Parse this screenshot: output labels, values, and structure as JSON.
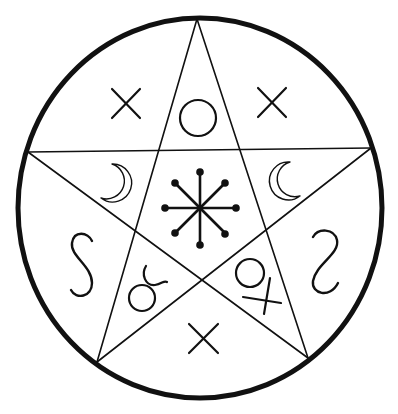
{
  "diagram": {
    "title": "Pentagram seal with planetary and alchemical symbols",
    "colors": {
      "ink": "#111111",
      "background": "#ffffff"
    },
    "outer_circle": {
      "cx": 200,
      "cy": 208,
      "rx": 182,
      "ry": 190,
      "stroke_width": 5
    },
    "pentagram": {
      "stroke_width": 1.6,
      "vertices": {
        "top": [
          197,
          19
        ],
        "left": [
          28,
          152
        ],
        "right": [
          371,
          148
        ],
        "bottom_left": [
          97,
          362
        ],
        "bottom_right": [
          308,
          358
        ]
      }
    },
    "symbols": [
      {
        "id": "cross-upper-left",
        "glyph": "cross",
        "region": "outer-upper-left",
        "x": 126,
        "y": 103
      },
      {
        "id": "circle-top",
        "glyph": "circle",
        "region": "top-point",
        "x": 198,
        "y": 118
      },
      {
        "id": "cross-upper-right",
        "glyph": "cross",
        "region": "outer-upper-right",
        "x": 271,
        "y": 102
      },
      {
        "id": "moon-left",
        "glyph": "crescent-moon-right-facing",
        "region": "left-point",
        "x": 122,
        "y": 181
      },
      {
        "id": "eight-spoke-star",
        "glyph": "eight-spoked-star-with-dots",
        "region": "center-pentagon",
        "x": 200,
        "y": 208
      },
      {
        "id": "moon-right",
        "glyph": "crescent-moon-left-facing",
        "region": "right-point",
        "x": 282,
        "y": 180
      },
      {
        "id": "s-left",
        "glyph": "s-curve",
        "region": "outer-left",
        "x": 82,
        "y": 265
      },
      {
        "id": "taurus",
        "glyph": "taurus-like-symbol",
        "region": "lower-left-point",
        "x": 145,
        "y": 290
      },
      {
        "id": "circle-cross",
        "glyph": "circle-with-cross",
        "region": "lower-right-point",
        "x": 257,
        "y": 283
      },
      {
        "id": "s-right",
        "glyph": "reversed-s-curve",
        "region": "outer-right",
        "x": 325,
        "y": 262
      },
      {
        "id": "cross-bottom",
        "glyph": "cross",
        "region": "outer-bottom",
        "x": 203,
        "y": 339
      }
    ]
  }
}
